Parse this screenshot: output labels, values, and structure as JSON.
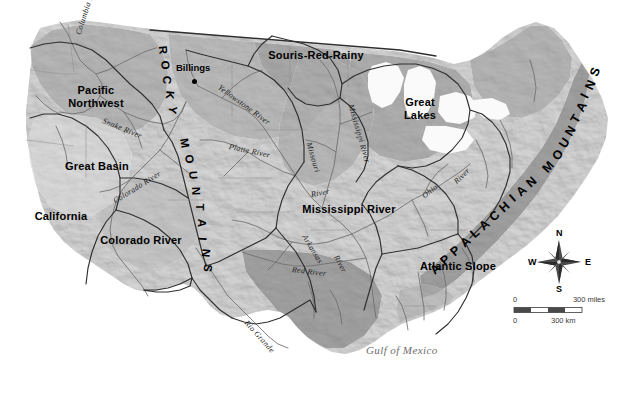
{
  "map": {
    "title": "United States Water Resource Regions",
    "background_color": "#ffffff",
    "terrain_light": "#d9d9d9",
    "terrain_mid": "#bdbdbd",
    "terrain_dark": "#a3a3a3",
    "boundary_color": "#3a3a3a",
    "river_color": "#5a5a5a"
  },
  "regions": [
    {
      "id": "pacific-northwest",
      "label": "Pacific\nNorthwest",
      "line1": "Pacific",
      "line2": "Northwest",
      "x": 62,
      "y": 85
    },
    {
      "id": "great-basin",
      "label": "Great Basin",
      "line1": "Great Basin",
      "line2": "",
      "x": 75,
      "y": 162
    },
    {
      "id": "california",
      "label": "California",
      "line1": "California",
      "line2": "",
      "x": 38,
      "y": 212
    },
    {
      "id": "colorado-river",
      "label": "Colorado River",
      "line1": "Colorado River",
      "line2": "",
      "x": 108,
      "y": 237
    },
    {
      "id": "souris-red-rainy",
      "label": "Souris-Red-Rainy",
      "line1": "Souris-Red-Rainy",
      "line2": "",
      "x": 258,
      "y": 55
    },
    {
      "id": "great-lakes",
      "label": "Great Lakes",
      "line1": "Great",
      "line2": "Lakes",
      "x": 398,
      "y": 100
    },
    {
      "id": "mississippi-river",
      "label": "Mississippi River",
      "line1": "Mississippi River",
      "line2": "",
      "x": 298,
      "y": 205
    },
    {
      "id": "atlantic-slope",
      "label": "Atlantic Slope",
      "line1": "Atlantic Slope",
      "line2": "",
      "x": 414,
      "y": 268
    }
  ],
  "rivers": [
    {
      "id": "columbia-river",
      "label": "Columbia River",
      "x": 78,
      "y": 30,
      "rotate": -72
    },
    {
      "id": "snake-river",
      "label": "Snake River",
      "x": 105,
      "y": 118,
      "rotate": 22
    },
    {
      "id": "yellowstone-river",
      "label": "Yellowstone River",
      "x": 222,
      "y": 82,
      "rotate": 36
    },
    {
      "id": "platte-river",
      "label": "Platte River",
      "x": 232,
      "y": 143,
      "rotate": 12
    },
    {
      "id": "missouri-river",
      "label": "Missouri",
      "x": 310,
      "y": 142,
      "rotate": 74
    },
    {
      "id": "mississippi-river-line",
      "label": "Mississippi River",
      "x": 352,
      "y": 100,
      "rotate": 74
    },
    {
      "id": "colorado-river-line",
      "label": "Colorado River",
      "x": 116,
      "y": 196,
      "rotate": -32
    },
    {
      "id": "arkansas-river",
      "label": "Arkansas",
      "x": 305,
      "y": 232,
      "rotate": 58
    },
    {
      "id": "arkansas-river-word",
      "label": "River",
      "x": 337,
      "y": 252,
      "rotate": 62
    },
    {
      "id": "red-river",
      "label": "Red River",
      "x": 295,
      "y": 266,
      "rotate": 7
    },
    {
      "id": "ohio-river",
      "label": "Ohio",
      "x": 424,
      "y": 192,
      "rotate": -38
    },
    {
      "id": "ohio-river-word",
      "label": "River",
      "x": 456,
      "y": 178,
      "rotate": -44
    },
    {
      "id": "rio-grande",
      "label": "Rio Grande",
      "x": 248,
      "y": 318,
      "rotate": 48
    },
    {
      "id": "upper-mississippi",
      "label": "River",
      "x": 313,
      "y": 190,
      "rotate": -10
    }
  ],
  "water_bodies": [
    {
      "id": "gulf-of-mexico",
      "label": "Gulf of Mexico",
      "x": 370,
      "y": 350
    }
  ],
  "cities": [
    {
      "id": "billings",
      "label": "Billings",
      "label_x": 176,
      "label_y": 68,
      "dot_x": 194,
      "dot_y": 82
    }
  ],
  "mountain_ranges": [
    {
      "id": "rocky-mountains",
      "label": "ROCKY MOUNTAINS",
      "letters": [
        {
          "ch": "R",
          "x": 161,
          "y": 50,
          "rot": 84
        },
        {
          "ch": "O",
          "x": 163,
          "y": 65,
          "rot": 88
        },
        {
          "ch": "C",
          "x": 165,
          "y": 80,
          "rot": 92
        },
        {
          "ch": "K",
          "x": 168,
          "y": 95,
          "rot": 96
        },
        {
          "ch": "Y",
          "x": 171,
          "y": 110,
          "rot": 100
        },
        {
          "ch": "M",
          "x": 184,
          "y": 143,
          "rot": 80
        },
        {
          "ch": "O",
          "x": 188,
          "y": 159,
          "rot": 83
        },
        {
          "ch": "U",
          "x": 192,
          "y": 175,
          "rot": 86
        },
        {
          "ch": "N",
          "x": 195,
          "y": 191,
          "rot": 88
        },
        {
          "ch": "T",
          "x": 198,
          "y": 207,
          "rot": 90
        },
        {
          "ch": "A",
          "x": 200,
          "y": 223,
          "rot": 92
        },
        {
          "ch": "I",
          "x": 202,
          "y": 239,
          "rot": 94
        },
        {
          "ch": "N",
          "x": 204,
          "y": 253,
          "rot": 96
        },
        {
          "ch": "S",
          "x": 206,
          "y": 268,
          "rot": 98
        }
      ]
    },
    {
      "id": "appalachian-mountains",
      "label": "APPALACHIAN MOUNTAINS",
      "letters": [
        {
          "ch": "A",
          "x": 433,
          "y": 268,
          "rot": -42
        },
        {
          "ch": "P",
          "x": 443,
          "y": 259,
          "rot": -42
        },
        {
          "ch": "P",
          "x": 453,
          "y": 250,
          "rot": -42
        },
        {
          "ch": "A",
          "x": 463,
          "y": 241,
          "rot": -42
        },
        {
          "ch": "L",
          "x": 473,
          "y": 232,
          "rot": -42
        },
        {
          "ch": "A",
          "x": 482,
          "y": 224,
          "rot": -42
        },
        {
          "ch": "C",
          "x": 492,
          "y": 215,
          "rot": -42
        },
        {
          "ch": "H",
          "x": 502,
          "y": 206,
          "rot": -42
        },
        {
          "ch": "I",
          "x": 512,
          "y": 197,
          "rot": -42
        },
        {
          "ch": "A",
          "x": 519,
          "y": 190,
          "rot": -42
        },
        {
          "ch": "N",
          "x": 529,
          "y": 181,
          "rot": -42
        },
        {
          "ch": "M",
          "x": 546,
          "y": 166,
          "rot": -48
        },
        {
          "ch": "O",
          "x": 555,
          "y": 154,
          "rot": -52
        },
        {
          "ch": "U",
          "x": 562,
          "y": 142,
          "rot": -56
        },
        {
          "ch": "N",
          "x": 568,
          "y": 130,
          "rot": -58
        },
        {
          "ch": "T",
          "x": 574,
          "y": 118,
          "rot": -60
        },
        {
          "ch": "A",
          "x": 579,
          "y": 106,
          "rot": -62
        },
        {
          "ch": "I",
          "x": 584,
          "y": 95,
          "rot": -64
        },
        {
          "ch": "N",
          "x": 588,
          "y": 84,
          "rot": -66
        },
        {
          "ch": "S",
          "x": 592,
          "y": 71,
          "rot": -68
        }
      ]
    }
  ],
  "compass": {
    "north": "N",
    "east": "E",
    "south": "S",
    "west": "W",
    "center_x": 559,
    "center_y": 262
  },
  "scale_bar": {
    "miles_zero": "0",
    "miles_max": "300 miles",
    "km_zero": "0",
    "km_max": "300 km",
    "x": 513,
    "y": 298,
    "width": 88
  }
}
